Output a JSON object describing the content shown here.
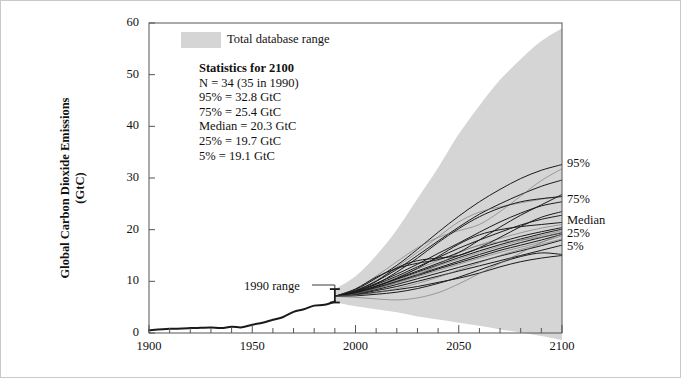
{
  "figure": {
    "background": "#ffffff",
    "border_color": "#c9c9c9",
    "band_color": "#d5d5d5",
    "line_color": "#1a1a1a",
    "axis_color": "#555555"
  },
  "legend": {
    "swatch_name": "total-database-range-swatch",
    "label": "Total database range",
    "swatch_color": "#d5d5d5"
  },
  "stats_box": {
    "heading": "Statistics for 2100",
    "lines": [
      "N = 34  (35 in 1990)",
      "95% = 32.8 GtC",
      "75% = 25.4 GtC",
      "Median = 20.3 GtC",
      "25% = 19.7 GtC",
      "5% = 19.1 GtC"
    ]
  },
  "annotations": {
    "range_1990": "1990 range"
  },
  "right_labels": [
    {
      "key": "p95",
      "label": "95%",
      "value": 32.8
    },
    {
      "key": "p75",
      "label": "75%",
      "value": 25.4
    },
    {
      "key": "median",
      "label": "Median",
      "value": 20.3
    },
    {
      "key": "p25",
      "label": "25%",
      "value": 19.7
    },
    {
      "key": "p5",
      "label": "5%",
      "value": 19.1
    }
  ],
  "chart_data": {
    "type": "line",
    "title": "",
    "xlabel": "",
    "ylabel": "Global Carbon Dioxide Emissions (GtC)",
    "ylabel_line1": "Global Carbon Dioxide Emissions",
    "ylabel_line2": "(GtC)",
    "xlim": [
      1900,
      2100
    ],
    "ylim": [
      0,
      60
    ],
    "xticks": [
      1900,
      1950,
      2000,
      2050,
      2100
    ],
    "xticklabels": [
      "1900",
      "1950",
      "2000",
      "2050",
      "2100"
    ],
    "xminor_step": 10,
    "yticks": [
      0,
      10,
      20,
      30,
      40,
      50,
      60
    ],
    "yticklabels": [
      "0",
      "10",
      "20",
      "30",
      "40",
      "50",
      "60"
    ],
    "grid": false,
    "legend_position": "top-left-inside",
    "units": "GtC",
    "historical": {
      "name": "Historical global CO2 emissions",
      "x": [
        1900,
        1910,
        1920,
        1925,
        1930,
        1935,
        1940,
        1945,
        1950,
        1955,
        1960,
        1965,
        1970,
        1975,
        1980,
        1985,
        1990
      ],
      "y": [
        0.55,
        0.8,
        0.95,
        1.0,
        1.05,
        0.95,
        1.2,
        1.1,
        1.6,
        2.0,
        2.55,
        3.1,
        4.1,
        4.6,
        5.3,
        5.45,
        6.1
      ]
    },
    "error_bar_1990": {
      "x": 1990,
      "low": 5.9,
      "high": 8.5,
      "center": 7.1,
      "caption": "1990 range"
    },
    "total_database_range": {
      "name": "Total database range",
      "x": [
        1990,
        2000,
        2010,
        2020,
        2030,
        2040,
        2050,
        2060,
        2070,
        2080,
        2090,
        2100
      ],
      "upper": [
        8.5,
        11.0,
        15.0,
        20.0,
        26.0,
        32.0,
        38.5,
        44.0,
        49.0,
        53.0,
        56.5,
        59.0
      ],
      "lower": [
        5.9,
        5.2,
        4.6,
        4.0,
        3.2,
        2.6,
        2.0,
        1.4,
        0.7,
        0.1,
        -0.6,
        -1.4
      ]
    },
    "scenarios": [
      {
        "name": "s1",
        "x": [
          1990,
          2000,
          2010,
          2020,
          2030,
          2040,
          2050,
          2060,
          2070,
          2080,
          2090,
          2100
        ],
        "y": [
          7.1,
          8.4,
          10.6,
          13.1,
          16.2,
          19.5,
          22.6,
          25.4,
          27.8,
          29.9,
          31.5,
          32.6
        ]
      },
      {
        "name": "s2",
        "x": [
          1990,
          2000,
          2010,
          2020,
          2030,
          2040,
          2050,
          2060,
          2070,
          2080,
          2090,
          2100
        ],
        "y": [
          7.1,
          8.2,
          10.0,
          12.3,
          15.0,
          17.8,
          20.5,
          23.0,
          25.0,
          26.8,
          28.4,
          29.6
        ]
      },
      {
        "name": "s3",
        "x": [
          1990,
          2000,
          2010,
          2020,
          2030,
          2040,
          2050,
          2060,
          2070,
          2080,
          2090,
          2100
        ],
        "y": [
          7.1,
          8.3,
          10.2,
          12.8,
          15.6,
          18.6,
          21.5,
          23.4,
          24.4,
          25.2,
          25.9,
          26.5
        ]
      },
      {
        "name": "s4",
        "x": [
          1990,
          2000,
          2010,
          2020,
          2030,
          2040,
          2050,
          2060,
          2070,
          2080,
          2090,
          2100
        ],
        "y": [
          7.1,
          8.1,
          9.6,
          11.4,
          13.3,
          15.4,
          17.4,
          19.5,
          21.5,
          23.2,
          24.6,
          25.4
        ]
      },
      {
        "name": "s5",
        "x": [
          1990,
          2000,
          2010,
          2020,
          2030,
          2040,
          2050,
          2060,
          2070,
          2080,
          2090,
          2100
        ],
        "y": [
          7.1,
          8.0,
          9.4,
          11.0,
          12.8,
          14.6,
          16.4,
          18.0,
          19.5,
          20.9,
          22.0,
          22.8
        ]
      },
      {
        "name": "s6",
        "x": [
          1990,
          2000,
          2010,
          2020,
          2030,
          2040,
          2050,
          2060,
          2070,
          2080,
          2090,
          2100
        ],
        "y": [
          7.1,
          8.0,
          9.2,
          10.8,
          12.4,
          14.0,
          15.6,
          17.0,
          18.3,
          19.4,
          20.3,
          21.0
        ]
      },
      {
        "name": "s7",
        "x": [
          1990,
          2000,
          2010,
          2020,
          2030,
          2040,
          2050,
          2060,
          2070,
          2080,
          2090,
          2100
        ],
        "y": [
          7.1,
          7.9,
          9.1,
          10.5,
          12.0,
          13.5,
          15.0,
          16.4,
          17.6,
          18.7,
          19.6,
          20.4
        ]
      },
      {
        "name": "s8",
        "x": [
          1990,
          2000,
          2010,
          2020,
          2030,
          2040,
          2050,
          2060,
          2070,
          2080,
          2090,
          2100
        ],
        "y": [
          7.1,
          7.9,
          9.0,
          10.4,
          11.8,
          13.2,
          14.6,
          15.9,
          17.1,
          18.2,
          19.2,
          20.1
        ]
      },
      {
        "name": "s9",
        "x": [
          1990,
          2000,
          2010,
          2020,
          2030,
          2040,
          2050,
          2060,
          2070,
          2080,
          2090,
          2100
        ],
        "y": [
          7.1,
          7.8,
          8.9,
          10.2,
          11.6,
          13.0,
          14.3,
          15.6,
          16.8,
          17.9,
          18.9,
          19.8
        ]
      },
      {
        "name": "s10",
        "x": [
          1990,
          2000,
          2010,
          2020,
          2030,
          2040,
          2050,
          2060,
          2070,
          2080,
          2090,
          2100
        ],
        "y": [
          7.1,
          7.8,
          8.8,
          10.0,
          11.3,
          12.6,
          13.9,
          15.2,
          16.4,
          17.5,
          18.5,
          19.4
        ]
      },
      {
        "name": "s11",
        "x": [
          1990,
          2000,
          2010,
          2020,
          2030,
          2040,
          2050,
          2060,
          2070,
          2080,
          2090,
          2100
        ],
        "y": [
          7.1,
          7.7,
          8.7,
          9.9,
          11.1,
          12.4,
          13.6,
          14.8,
          16.0,
          17.0,
          18.0,
          19.1
        ]
      },
      {
        "name": "s12",
        "x": [
          1990,
          2000,
          2010,
          2020,
          2030,
          2040,
          2050,
          2060,
          2070,
          2080,
          2090,
          2100
        ],
        "y": [
          7.1,
          7.7,
          8.6,
          9.7,
          10.9,
          12.1,
          13.3,
          14.5,
          15.6,
          16.6,
          17.6,
          18.8
        ]
      },
      {
        "name": "s13",
        "x": [
          1990,
          2000,
          2010,
          2020,
          2030,
          2040,
          2050,
          2060,
          2070,
          2080,
          2090,
          2100
        ],
        "y": [
          7.1,
          7.6,
          8.4,
          9.4,
          10.5,
          11.6,
          12.7,
          13.8,
          14.9,
          15.9,
          16.9,
          18.0
        ]
      },
      {
        "name": "s14",
        "x": [
          1990,
          2000,
          2010,
          2020,
          2030,
          2040,
          2050,
          2060,
          2070,
          2080,
          2090,
          2100
        ],
        "y": [
          7.1,
          8.2,
          10.0,
          12.6,
          14.0,
          14.5,
          15.0,
          16.5,
          18.5,
          20.6,
          22.4,
          23.5
        ]
      },
      {
        "name": "s15",
        "x": [
          1990,
          2000,
          2010,
          2020,
          2030,
          2040,
          2050,
          2060,
          2070,
          2080,
          2090,
          2100
        ],
        "y": [
          7.1,
          8.6,
          11.0,
          13.8,
          16.5,
          18.5,
          19.8,
          21.0,
          23.5,
          26.5,
          29.5,
          31.8
        ]
      },
      {
        "name": "s16",
        "x": [
          1990,
          2000,
          2010,
          2020,
          2030,
          2040,
          2050,
          2060,
          2070,
          2080,
          2090,
          2100
        ],
        "y": [
          7.1,
          7.5,
          8.2,
          9.0,
          10.0,
          11.0,
          12.0,
          13.0,
          14.0,
          15.0,
          16.0,
          17.0
        ]
      },
      {
        "name": "s17",
        "x": [
          1990,
          2000,
          2010,
          2020,
          2030,
          2040,
          2050,
          2060,
          2070,
          2080,
          2090,
          2100
        ],
        "y": [
          7.1,
          7.4,
          7.9,
          8.4,
          9.0,
          9.8,
          10.6,
          11.6,
          12.8,
          13.8,
          14.5,
          15.0
        ]
      },
      {
        "name": "s18",
        "x": [
          1990,
          2000,
          2010,
          2020,
          2030,
          2040,
          2050,
          2060,
          2070,
          2080,
          2090,
          2100
        ],
        "y": [
          7.1,
          7.6,
          8.6,
          9.8,
          11.2,
          13.2,
          15.5,
          17.0,
          17.6,
          18.0,
          18.6,
          19.5
        ]
      },
      {
        "name": "s19",
        "x": [
          1990,
          2000,
          2010,
          2020,
          2030,
          2040,
          2050,
          2060,
          2070,
          2080,
          2090,
          2100
        ],
        "y": [
          7.1,
          7.2,
          7.5,
          7.9,
          8.6,
          9.6,
          10.8,
          12.2,
          13.6,
          14.8,
          15.5,
          15.2
        ]
      },
      {
        "name": "s20",
        "x": [
          1990,
          2000,
          2010,
          2020,
          2030,
          2040,
          2050,
          2060,
          2070,
          2080,
          2090,
          2100
        ],
        "y": [
          7.1,
          8.5,
          10.8,
          12.5,
          13.5,
          14.2,
          15.6,
          18.0,
          20.5,
          22.8,
          24.8,
          26.8
        ]
      },
      {
        "name": "s21",
        "x": [
          1990,
          2000,
          2010,
          2020,
          2030,
          2040,
          2050,
          2060,
          2070,
          2080,
          2090,
          2100
        ],
        "y": [
          7.1,
          6.9,
          6.6,
          6.4,
          6.8,
          7.8,
          9.5,
          11.5,
          13.5,
          15.5,
          17.5,
          19.2
        ]
      },
      {
        "name": "s22",
        "x": [
          1990,
          2000,
          2010,
          2020,
          2030,
          2040,
          2050,
          2060,
          2070,
          2080,
          2090,
          2100
        ],
        "y": [
          7.1,
          8.0,
          9.5,
          11.8,
          14.5,
          17.5,
          20.2,
          22.5,
          24.2,
          25.4,
          26.0,
          26.4
        ]
      },
      {
        "name": "s23",
        "x": [
          1990,
          2000,
          2010,
          2020,
          2030,
          2040,
          2050,
          2060,
          2070,
          2080,
          2090,
          2100
        ],
        "y": [
          7.1,
          7.8,
          9.0,
          10.6,
          12.5,
          14.8,
          17.2,
          19.0,
          20.0,
          20.6,
          21.0,
          21.4
        ]
      },
      {
        "name": "s24",
        "x": [
          1990,
          2000,
          2010,
          2020,
          2030,
          2040,
          2050,
          2060,
          2070,
          2080,
          2090,
          2100
        ],
        "y": [
          7.1,
          7.3,
          7.8,
          8.6,
          9.6,
          10.8,
          12.2,
          13.6,
          15.0,
          16.2,
          17.2,
          18.2
        ]
      }
    ]
  }
}
